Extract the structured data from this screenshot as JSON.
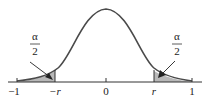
{
  "diagram": {
    "type": "symmetric distribution with two shaded tails",
    "axis": {
      "tick_labels": [
        "−1",
        "−r",
        "0",
        "r",
        "1"
      ]
    },
    "tail_labels": {
      "left": {
        "numerator": "α",
        "denominator": "2"
      },
      "right": {
        "numerator": "α",
        "denominator": "2"
      }
    },
    "colors": {
      "curve": "#4a4a4a",
      "shade": "#b8b8b8",
      "axis": "#333333"
    }
  }
}
